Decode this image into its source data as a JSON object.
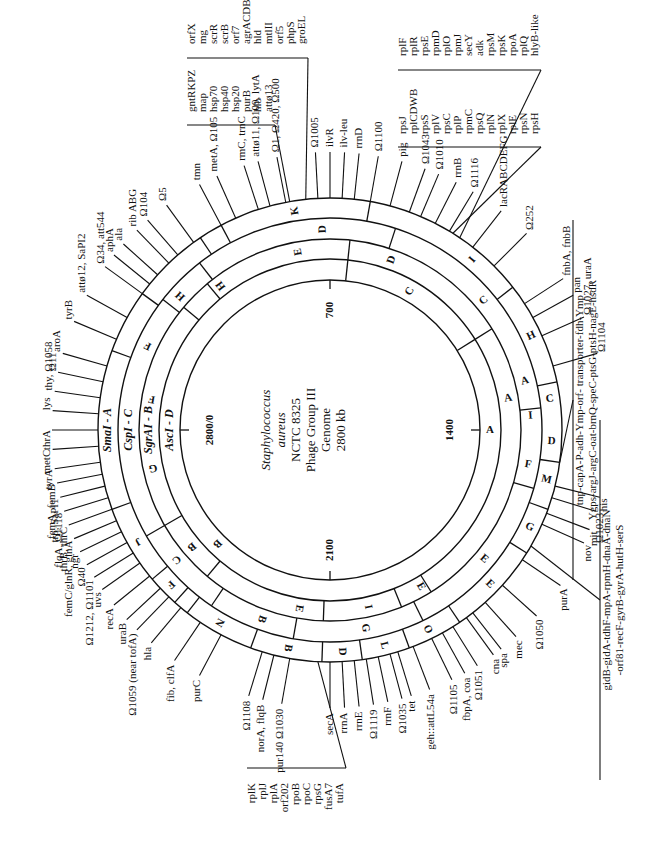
{
  "figure": {
    "title_lines": [
      "Staphylococcus",
      "aureus",
      "NCTC 8325",
      "Phage Group III",
      "Genome",
      "2800 kb"
    ],
    "scale_marks": [
      {
        "label": "2800/0",
        "kb": 0
      },
      {
        "label": "700",
        "kb": 700
      },
      {
        "label": "1400",
        "kb": 1400
      },
      {
        "label": "2100",
        "kb": 2100
      }
    ],
    "rings": [
      {
        "enzyme": "SmaI - A",
        "segments": [
          "A",
          "K",
          "I",
          "H",
          "C",
          "D",
          "M",
          "G",
          "E",
          "O",
          "L",
          "D",
          "B",
          "N",
          "F",
          "J"
        ]
      },
      {
        "enzyme": "CspI - C",
        "segments": [
          "D",
          "C",
          "A",
          "I",
          "F",
          "E",
          "G",
          "B",
          "C",
          "H",
          "F"
        ]
      },
      {
        "enzyme": "SgrAI - B",
        "segments": [
          "F",
          "H",
          "E",
          "D",
          "A",
          "E",
          "I",
          "E",
          "B",
          "G",
          "F"
        ]
      },
      {
        "enzyme": "AscI - D",
        "segments": [
          "C",
          "A",
          "B"
        ]
      }
    ],
    "gene_groups": [
      {
        "name": "group-gntRKPZ",
        "genes": [
          "gntRKPZ",
          "map",
          "hsp70",
          "hsp40",
          "hsp20",
          "purB",
          "hlb",
          "attø13"
        ]
      },
      {
        "name": "group-orfX",
        "genes": [
          "orfX",
          "mg",
          "scrR",
          "scrB",
          "orf7",
          "agrACDB",
          "hld",
          "mtlII",
          "orf5",
          "phpS",
          "groEL"
        ]
      },
      {
        "name": "group-rpsJ",
        "genes": [
          "rpsJ",
          "rplCDWB",
          "rpsS",
          "rplV",
          "rpsC",
          "rplP",
          "rpmC",
          "rpsQ",
          "rplN",
          "rplX",
          "rplE",
          "rpsN",
          "rpsH"
        ]
      },
      {
        "name": "group-rplF",
        "genes": [
          "rplF",
          "rplR",
          "rpsE",
          "rpmD",
          "rplO",
          "rpmJ",
          "secY",
          "adk",
          "rpsM",
          "rpsK",
          "rpoA",
          "rplQ",
          "hlyB-like"
        ]
      },
      {
        "name": "group-rplK",
        "genes": [
          "rplK",
          "rplJ",
          "rplA",
          "orf202",
          "rpoB",
          "rpoC",
          "rpsG",
          "fusA7",
          "tufA"
        ]
      },
      {
        "name": "group-tnp",
        "genes": [
          "tnp-capA-P-adh-Ymp-orf- transporter-fdh-Ymp",
          "Ygps-argJ-argC-oat-brnQ-speC-ptsG-ptsH-nagE-hsdR"
        ]
      },
      {
        "name": "group-gidB",
        "genes": [
          "gidB-gidA-tdhF-mpA-rpmH-dnaA-dnaN",
          "-orf81-recF-gyrB-gyrA-hutH-serS"
        ]
      }
    ],
    "markers": [
      "tmn",
      "metA, Ω105",
      "rmC, trnC",
      "attø11, Ω109, lytA",
      "Ω1, Ω420, Ω500",
      "Ω1005",
      "ilvR",
      "ilv-leu",
      "rrnD",
      "Ω1100",
      "pig",
      "Ω1043",
      "Ω1010",
      "rrnB",
      "Ω1116",
      "lacRABCDEFG",
      "Ω252",
      "fnbA, fnbB",
      "pan",
      "Ω1027, uraA",
      "Ω1104",
      "his",
      "Ω1023",
      "mit",
      "nov",
      "purA",
      "Ω1050",
      "mec",
      "spa",
      "cna",
      "Ω1051",
      "fbpA, coa",
      "Ω1105",
      "geh::attL54a",
      "tet",
      "Ω1035",
      "rrnF",
      "Ω1119",
      "rrnE",
      "rrnA",
      "secA",
      "pur140 Ω1030",
      "norA, flqB",
      "Ω1108",
      "purC",
      "fib, clfA",
      "hla",
      "Ω1059 (near tofA)",
      "uraB",
      "recA",
      "uvs",
      "Ω1212, Ω1101",
      "Ω40",
      "ngr",
      "femC/glnR, glnA",
      "thrB, thrC",
      "flqA, Ω1118",
      "trp, SaPI1",
      "femA, femB",
      "tyrA",
      "metC",
      "thrA",
      "lys",
      "thy, Ω1058",
      "Ω11",
      "aroA",
      "tyrB",
      "attø12, SaPI2",
      "Ω34, att544",
      "aphA",
      "ala",
      "rib ABG",
      "Ω104",
      "Ω5"
    ]
  }
}
